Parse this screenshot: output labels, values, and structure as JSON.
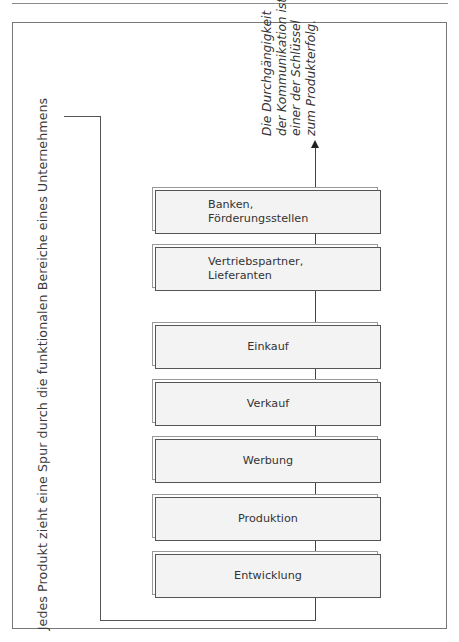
{
  "diagram": {
    "side_label": "Jedes Produkt zieht eine Spur durch die funktionalen Bereiche eines Unternehmens",
    "note": {
      "lines": [
        "Die Durchgängigkeit",
        "der Kommunikation ist",
        "einer der Schlüssel",
        "zum Produkterfolg."
      ]
    },
    "boxes": [
      {
        "label": "Banken,\nFörderungsstellen",
        "line1": "Banken,",
        "line2": "Förderungsstellen"
      },
      {
        "label": "Vertriebspartner,\nLieferanten",
        "line1": "Vertriebspartner,",
        "line2": "Lieferanten"
      },
      {
        "label": "Einkauf"
      },
      {
        "label": "Verkauf"
      },
      {
        "label": "Werbung"
      },
      {
        "label": "Produktion"
      },
      {
        "label": "Entwicklung"
      }
    ]
  }
}
